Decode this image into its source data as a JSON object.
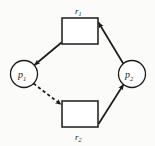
{
  "figure": {
    "kind": "resource-allocation-graph",
    "background_color": "#fbfbf9",
    "stroke_color": "#1b1b1b",
    "fill_color": "#ffffff",
    "width": 155,
    "height": 146
  },
  "processes": [
    {
      "id": "p1",
      "base": "p",
      "subscript": "1",
      "shape": "circle",
      "cx": 24,
      "cy": 74,
      "r": 13.5
    },
    {
      "id": "p2",
      "base": "p",
      "subscript": "2",
      "shape": "circle",
      "cx": 132,
      "cy": 74,
      "r": 13.5
    }
  ],
  "resources": [
    {
      "id": "r1",
      "base": "r",
      "subscript": "1",
      "shape": "rectangle",
      "x": 62,
      "y": 18,
      "width": 36,
      "height": 26,
      "label_position": "above"
    },
    {
      "id": "r2",
      "base": "r",
      "subscript": "2",
      "shape": "rectangle",
      "x": 62,
      "y": 101,
      "width": 36,
      "height": 26,
      "label_position": "below"
    }
  ],
  "edges": [
    {
      "id": "edge-r1-to-p1",
      "from": "r1",
      "to": "p1",
      "style": "solid",
      "arrow": "at-target",
      "meaning": "assignment",
      "x1": 61.5,
      "y1": 42.5,
      "x2": 34.5,
      "y2": 65.0
    },
    {
      "id": "edge-p1-to-r2",
      "from": "p1",
      "to": "r2",
      "style": "dashed",
      "arrow": "at-target",
      "meaning": "claim-request",
      "x1": 33.5,
      "y1": 83.5,
      "x2": 61.0,
      "y2": 104.5
    },
    {
      "id": "edge-r2-to-p2",
      "from": "r2",
      "to": "p2",
      "style": "solid",
      "arrow": "at-target",
      "meaning": "assignment",
      "x1": 98.5,
      "y1": 124.0,
      "x2": 123.5,
      "y2": 84.5
    },
    {
      "id": "edge-p2-to-r1",
      "from": "p2",
      "to": "r1",
      "style": "solid",
      "arrow": "at-target",
      "meaning": "request",
      "x1": 123.5,
      "y1": 64.0,
      "x2": 98.5,
      "y2": 22.5
    }
  ],
  "labels": {
    "r1": {
      "text": "r",
      "sub": "1",
      "x": 75,
      "y": 14
    },
    "r2": {
      "text": "r",
      "sub": "2",
      "x": 75,
      "y": 140
    },
    "p1": {
      "text": "p",
      "sub": "1",
      "x": 18,
      "y": 78
    },
    "p2": {
      "text": "p",
      "sub": "2",
      "x": 126,
      "y": 78
    }
  }
}
